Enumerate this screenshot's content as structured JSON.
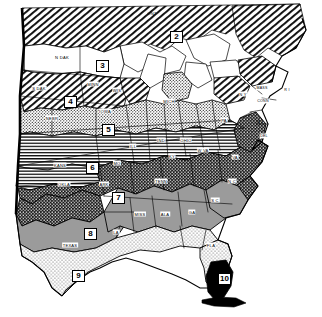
{
  "figure": {
    "kind": "thematic-map",
    "title_visible": false,
    "background_color": "#ffffff",
    "ink_color": "#000000"
  },
  "zones": [
    {
      "id": "zone-2",
      "number": "2",
      "pattern": "diagonal-hatch-right",
      "x": 170,
      "y": 31,
      "region": "Ontario / southern Canada"
    },
    {
      "id": "zone-3",
      "number": "3",
      "pattern": "blank-white",
      "x": 96,
      "y": 60,
      "region": "Northern Plains"
    },
    {
      "id": "zone-4",
      "number": "4",
      "pattern": "diagonal-hatch-right",
      "x": 64,
      "y": 96,
      "region": "Dakotas / Minnesota"
    },
    {
      "id": "zone-5",
      "number": "5",
      "pattern": "fine-stipple",
      "x": 102,
      "y": 124,
      "region": "Corn Belt"
    },
    {
      "id": "zone-6",
      "number": "6",
      "pattern": "horizontal-lines",
      "x": 86,
      "y": 162,
      "region": "Kansas / Missouri"
    },
    {
      "id": "zone-7",
      "number": "7",
      "pattern": "dark-crosshatch",
      "x": 112,
      "y": 192,
      "region": "Upland South"
    },
    {
      "id": "zone-8",
      "number": "8",
      "pattern": "medium-gray",
      "x": 84,
      "y": 228,
      "region": "Texas / Gulf South"
    },
    {
      "id": "zone-9",
      "number": "9",
      "pattern": "light-stipple",
      "x": 72,
      "y": 270,
      "region": "South Texas / Gulf Coast"
    },
    {
      "id": "zone-10",
      "number": "10",
      "pattern": "solid-black",
      "x": 224,
      "y": 273,
      "region": "South Florida"
    }
  ],
  "state_labels": [
    {
      "text": "N DAK",
      "x": 62,
      "y": 57
    },
    {
      "text": "S DAK",
      "x": 39,
      "y": 88
    },
    {
      "text": "MINN",
      "x": 93,
      "y": 84
    },
    {
      "text": "WIS",
      "x": 117,
      "y": 90
    },
    {
      "text": "NEBR",
      "x": 52,
      "y": 118
    },
    {
      "text": "IOWA",
      "x": 105,
      "y": 111
    },
    {
      "text": "MICH",
      "x": 169,
      "y": 101
    },
    {
      "text": "ONT",
      "x": 152,
      "y": 13
    },
    {
      "text": "KANS",
      "x": 60,
      "y": 165
    },
    {
      "text": "MO",
      "x": 117,
      "y": 163
    },
    {
      "text": "ILL",
      "x": 133,
      "y": 146
    },
    {
      "text": "IND",
      "x": 161,
      "y": 140
    },
    {
      "text": "OHIO",
      "x": 186,
      "y": 140
    },
    {
      "text": "KY",
      "x": 172,
      "y": 156
    },
    {
      "text": "W VA",
      "x": 203,
      "y": 150
    },
    {
      "text": "PA",
      "x": 224,
      "y": 120
    },
    {
      "text": "N Y",
      "x": 243,
      "y": 94
    },
    {
      "text": "MASS",
      "x": 262,
      "y": 88
    },
    {
      "text": "CONN",
      "x": 263,
      "y": 101
    },
    {
      "text": "R I",
      "x": 287,
      "y": 90
    },
    {
      "text": "N J",
      "x": 260,
      "y": 122
    },
    {
      "text": "DEL",
      "x": 264,
      "y": 136
    },
    {
      "text": "VA",
      "x": 235,
      "y": 157
    },
    {
      "text": "OKLA",
      "x": 64,
      "y": 184
    },
    {
      "text": "ARK",
      "x": 104,
      "y": 184
    },
    {
      "text": "TENN",
      "x": 161,
      "y": 181
    },
    {
      "text": "N C",
      "x": 232,
      "y": 181
    },
    {
      "text": "S C",
      "x": 215,
      "y": 200
    },
    {
      "text": "MISS",
      "x": 140,
      "y": 214
    },
    {
      "text": "ALA",
      "x": 165,
      "y": 214
    },
    {
      "text": "GA",
      "x": 192,
      "y": 212
    },
    {
      "text": "LA",
      "x": 116,
      "y": 232
    },
    {
      "text": "TEXAS",
      "x": 70,
      "y": 245
    },
    {
      "text": "FLA",
      "x": 211,
      "y": 245
    }
  ],
  "legend": {
    "present": false,
    "note": "No legend, axes, or caption text appears within the image bounds"
  }
}
